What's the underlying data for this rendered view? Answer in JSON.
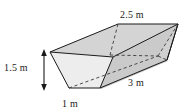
{
  "figure": {
    "name": "trapezoidal-prism-trough",
    "shape_type": "trapezoidal prism",
    "unit": "m",
    "fill_color": "#cfcfcf",
    "fill_color_light": "#e8e8e8",
    "fill_color_mid": "#dcdcdc",
    "line_color": "#1a1a1a",
    "hidden_line_color": "#5a5a5a",
    "background": "#ffffff"
  },
  "labels": {
    "top_width": "2.5 m",
    "height": "1.5 m",
    "bottom_width": "1 m",
    "length": "3 m"
  },
  "dimensions": [
    {
      "name": "top_width",
      "value": 2.5,
      "unit": "m",
      "text": "2.5 m"
    },
    {
      "name": "height",
      "value": 1.5,
      "unit": "m",
      "text": "1.5 m"
    },
    {
      "name": "bottom_width",
      "value": 1,
      "unit": "m",
      "text": "1 m"
    },
    {
      "name": "length",
      "value": 3,
      "unit": "m",
      "text": "3 m"
    }
  ],
  "annotations": {
    "height_arrow": "double-headed-vertical-arrow"
  }
}
